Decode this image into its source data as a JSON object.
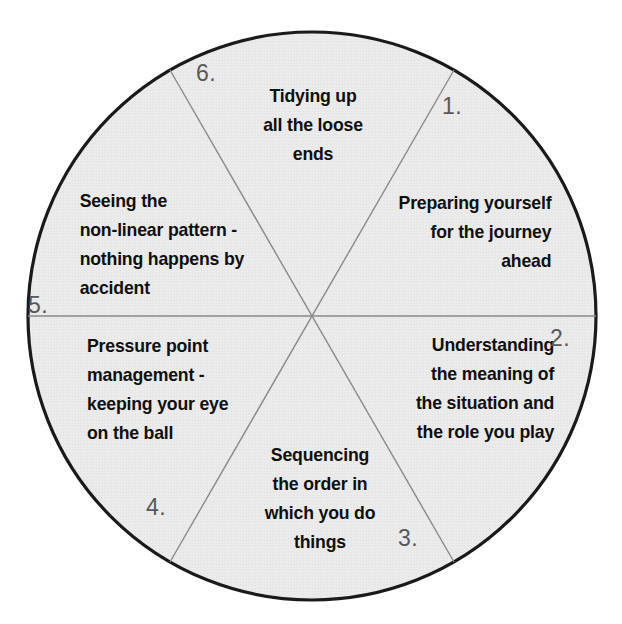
{
  "diagram": {
    "type": "six-segment-pie-wheel",
    "title_visible": false,
    "colors": {
      "circle_fill": "#ebebeb",
      "circle_stroke": "#1a1a1a",
      "divider_stroke": "#8a8a8a",
      "text": "#100f0f",
      "number": "#58585a",
      "page_background": "#ffffff"
    },
    "geometry": {
      "center_x": 312,
      "center_y": 316,
      "radius": 284
    },
    "segments": [
      {
        "number": "1.",
        "text": "Preparing yourself\nfor the journey\nahead",
        "position": "upper-right",
        "align": "right"
      },
      {
        "number": "2.",
        "text": "Understanding\nthe meaning of\nthe situation and\nthe role you play",
        "position": "lower-right",
        "align": "right"
      },
      {
        "number": "3.",
        "text": "Sequencing\nthe order in\nwhich you do\nthings",
        "position": "bottom",
        "align": "center"
      },
      {
        "number": "4.",
        "text": "Pressure point\nmanagement -\nkeeping your eye\non the ball",
        "position": "lower-left",
        "align": "left"
      },
      {
        "number": "5.",
        "text": "Seeing the\nnon-linear pattern -\nnothing happens by\naccident",
        "position": "upper-left",
        "align": "left"
      },
      {
        "number": "6.",
        "text": "Tidying up\nall the loose\nends",
        "position": "top",
        "align": "center"
      }
    ]
  }
}
